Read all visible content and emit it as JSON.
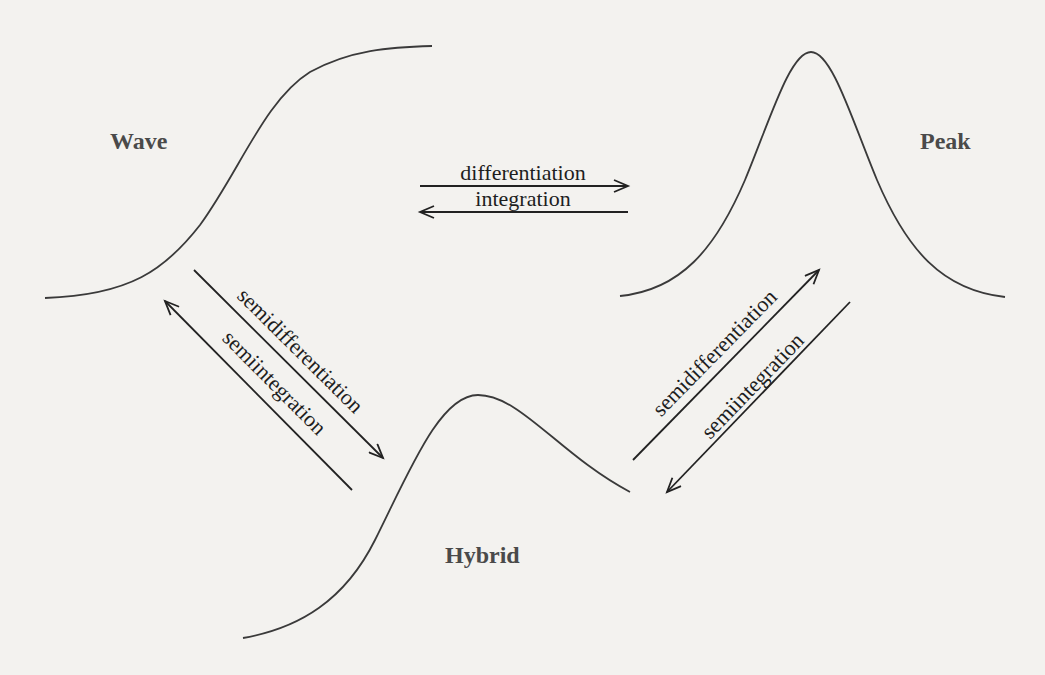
{
  "diagram": {
    "nodes": {
      "wave": {
        "label": "Wave",
        "shape": "sigmoid"
      },
      "peak": {
        "label": "Peak",
        "shape": "gaussian"
      },
      "hybrid": {
        "label": "Hybrid",
        "shape": "asymmetric-peak"
      }
    },
    "edges": {
      "wave_to_peak": {
        "label": "differentiation",
        "from": "Wave",
        "to": "Peak"
      },
      "peak_to_wave": {
        "label": "integration",
        "from": "Peak",
        "to": "Wave"
      },
      "wave_to_hybrid": {
        "label": "semidifferentiation",
        "from": "Wave",
        "to": "Hybrid"
      },
      "hybrid_to_wave": {
        "label": "semiintegration",
        "from": "Hybrid",
        "to": "Wave"
      },
      "hybrid_to_peak": {
        "label": "semidifferentiation",
        "from": "Hybrid",
        "to": "Peak"
      },
      "peak_to_hybrid": {
        "label": "semiintegration",
        "from": "Peak",
        "to": "Hybrid"
      }
    },
    "colors": {
      "background": "#f3f2ef",
      "curve": "#3a3a3a",
      "node_label": "#4a4a4a",
      "edge_label": "#1e1e1e"
    }
  }
}
